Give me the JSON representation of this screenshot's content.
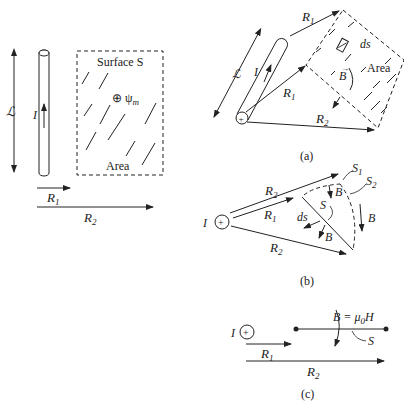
{
  "left_figure": {
    "length_label": "ℒ",
    "current_label": "I",
    "surface_label": "Surface S",
    "flux_label": "⊕ ψ",
    "flux_subscript": "m",
    "area_label": "Area",
    "r1_label": "R",
    "r1_sub": "1",
    "r2_label": "R",
    "r2_sub": "2"
  },
  "figure_a": {
    "caption": "(a)",
    "length_label": "ℒ",
    "current_label": "I",
    "r1_top_label": "R",
    "r1_top_sub": "1",
    "r1_mid_label": "R",
    "r1_mid_sub": "1",
    "r2_label": "R",
    "r2_sub": "2",
    "ds_label": "ds",
    "b_label": "B",
    "area_label": "Area",
    "source_symbol": "+"
  },
  "figure_b": {
    "caption": "(b)",
    "current_label": "I",
    "source_symbol": "+",
    "r2_top_label": "R",
    "r2_top_sub": "2",
    "r1_label": "R",
    "r1_sub": "1",
    "r2_bottom_label": "R",
    "r2_bottom_sub": "2",
    "s1_label": "S",
    "s1_sub": "1",
    "s2_label": "S",
    "s2_sub": "2",
    "s_label": "S",
    "ds_label": "ds",
    "b_labels": [
      "B",
      "B",
      "B"
    ]
  },
  "figure_c": {
    "caption": "(c)",
    "current_label": "I",
    "source_symbol": "+",
    "b_eq_label": "B = μ",
    "mu_sub": "0",
    "h_label": "H",
    "s_label": "S",
    "r1_label": "R",
    "r1_sub": "1",
    "r2_label": "R",
    "r2_sub": "2"
  }
}
